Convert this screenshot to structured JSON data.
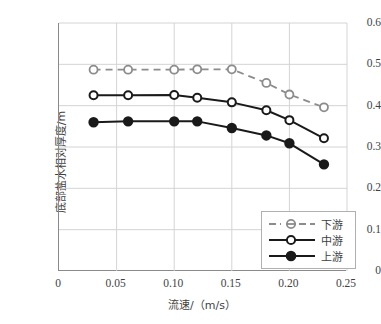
{
  "chart_data": {
    "type": "line",
    "title": "",
    "xlabel": "流速/（m/s）",
    "ylabel": "底部盐水相对厚度/m",
    "xlim": [
      0,
      0.25
    ],
    "ylim": [
      0,
      0.6
    ],
    "xticks": [
      "0",
      "0.05",
      "0.10",
      "0.15",
      "0.20",
      "0.25"
    ],
    "xtick_values": [
      0,
      0.05,
      0.1,
      0.15,
      0.2,
      0.25
    ],
    "yticks": [
      "0",
      "0.1",
      "0.2",
      "0.3",
      "0.4",
      "0.5",
      "0.6"
    ],
    "ytick_values": [
      0,
      0.1,
      0.2,
      0.3,
      0.4,
      0.5,
      0.6
    ],
    "grid": true,
    "legend_position": "lower right",
    "x": [
      0.03,
      0.06,
      0.1,
      0.12,
      0.15,
      0.18,
      0.2,
      0.23
    ],
    "series": [
      {
        "name": "下游",
        "color": "#8c8c8c",
        "linestyle": "dashed",
        "marker": "open-circle",
        "values": [
          0.487,
          0.487,
          0.487,
          0.488,
          0.488,
          0.455,
          0.427,
          0.396
        ]
      },
      {
        "name": "中游",
        "color": "#1a1a1a",
        "linestyle": "solid",
        "marker": "open-circle",
        "values": [
          0.425,
          0.425,
          0.426,
          0.419,
          0.408,
          0.389,
          0.365,
          0.321
        ]
      },
      {
        "name": "上游",
        "color": "#1a1a1a",
        "linestyle": "solid",
        "marker": "filled-circle",
        "values": [
          0.36,
          0.362,
          0.362,
          0.362,
          0.346,
          0.328,
          0.309,
          0.258
        ]
      }
    ]
  },
  "legend": {
    "items": [
      {
        "label": "下游"
      },
      {
        "label": "中游"
      },
      {
        "label": "上游"
      }
    ]
  },
  "colors": {
    "downstream": "#8c8c8c",
    "midstream": "#1a1a1a",
    "upstream": "#1a1a1a",
    "grid": "#d4d4d4",
    "axis": "#8a8a8a"
  }
}
